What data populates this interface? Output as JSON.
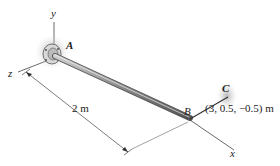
{
  "diagram": {
    "axes": {
      "y_label": "y",
      "z_label": "z",
      "x_label": "x"
    },
    "points": {
      "A": "A",
      "B": "B",
      "C": "C"
    },
    "dimension": {
      "length_label": "2 m"
    },
    "coordinates_label": "(3, 0.5, −0.5) m",
    "colors": {
      "rod": "#8a8a8a",
      "cable": "#333333",
      "shadow": "#bdbdbd",
      "text": "#222222"
    }
  }
}
